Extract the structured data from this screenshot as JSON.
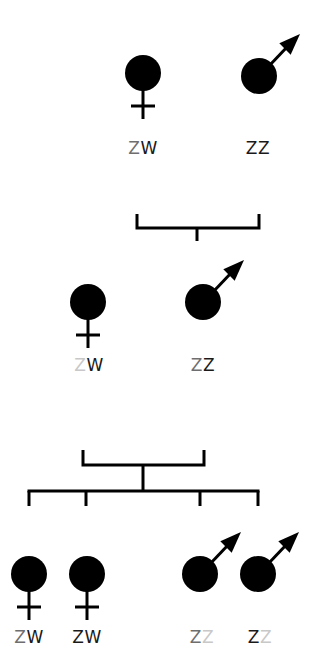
{
  "diagram": {
    "title": "",
    "colors": {
      "symbol": "#000000",
      "allele_dark": "#1a1a1a",
      "allele_mid": "#6e6e6e",
      "allele_light": "#c8c8c8"
    },
    "generations": [
      {
        "name": "P",
        "individuals": [
          {
            "sex": "female",
            "icon": "female-symbol-icon",
            "cx": 143,
            "cy": 73,
            "genotype": "ZW",
            "alleles": [
              {
                "letter": "Z",
                "tone": "mid"
              },
              {
                "letter": "W",
                "tone": "dark"
              }
            ],
            "label_x": 143,
            "label_y": 140
          },
          {
            "sex": "male",
            "icon": "male-symbol-icon",
            "cx": 259,
            "cy": 76,
            "genotype": "ZZ",
            "alleles": [
              {
                "letter": "Z",
                "tone": "dark"
              },
              {
                "letter": "Z",
                "tone": "dark"
              }
            ],
            "label_x": 258,
            "label_y": 140
          }
        ]
      },
      {
        "name": "F1",
        "individuals": [
          {
            "sex": "female",
            "icon": "female-symbol-icon",
            "cx": 88,
            "cy": 302,
            "genotype": "ZW",
            "alleles": [
              {
                "letter": "Z",
                "tone": "light"
              },
              {
                "letter": "W",
                "tone": "dark"
              }
            ],
            "label_x": 89,
            "label_y": 357
          },
          {
            "sex": "male",
            "icon": "male-symbol-icon",
            "cx": 203,
            "cy": 302,
            "genotype": "ZZ",
            "alleles": [
              {
                "letter": "Z",
                "tone": "mid"
              },
              {
                "letter": "Z",
                "tone": "dark"
              }
            ],
            "label_x": 203,
            "label_y": 357
          }
        ]
      },
      {
        "name": "F2",
        "individuals": [
          {
            "sex": "female",
            "icon": "female-symbol-icon",
            "cx": 29,
            "cy": 574,
            "genotype": "ZW",
            "alleles": [
              {
                "letter": "Z",
                "tone": "mid"
              },
              {
                "letter": "W",
                "tone": "dark"
              }
            ],
            "label_x": 29,
            "label_y": 629
          },
          {
            "sex": "female",
            "icon": "female-symbol-icon",
            "cx": 87,
            "cy": 574,
            "genotype": "ZW",
            "alleles": [
              {
                "letter": "Z",
                "tone": "dark"
              },
              {
                "letter": "W",
                "tone": "dark"
              }
            ],
            "label_x": 87,
            "label_y": 629
          },
          {
            "sex": "male",
            "icon": "male-symbol-icon",
            "cx": 200,
            "cy": 574,
            "genotype": "ZZ",
            "alleles": [
              {
                "letter": "Z",
                "tone": "mid"
              },
              {
                "letter": "Z",
                "tone": "light"
              }
            ],
            "label_x": 202,
            "label_y": 629
          },
          {
            "sex": "male",
            "icon": "male-symbol-icon",
            "cx": 258,
            "cy": 574,
            "genotype": "ZZ",
            "alleles": [
              {
                "letter": "Z",
                "tone": "dark"
              },
              {
                "letter": "Z",
                "tone": "light"
              }
            ],
            "label_x": 260,
            "label_y": 629
          }
        ]
      }
    ],
    "cross_lines": [
      {
        "name": "cross-bracket-p",
        "left": 137,
        "right": 259,
        "top": 214,
        "bar": 228,
        "stem_x": 197,
        "stem_end": 241
      },
      {
        "name": "cross-bracket-f1",
        "left": 83,
        "right": 204,
        "top": 450,
        "bar": 465,
        "stem_x": 143,
        "stem_end": 491
      }
    ],
    "offspring_line": {
      "y": 491,
      "left": 29,
      "right": 258,
      "drops": [
        29,
        86,
        200,
        258
      ],
      "drop_end": 506
    }
  }
}
